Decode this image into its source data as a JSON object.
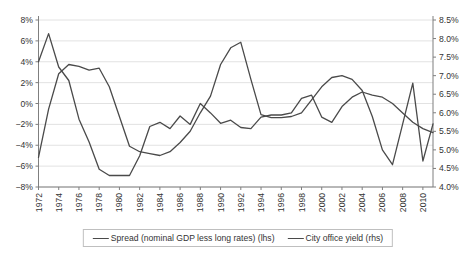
{
  "chart_data": {
    "type": "line",
    "x": [
      1972,
      1973,
      1974,
      1975,
      1976,
      1977,
      1978,
      1979,
      1980,
      1981,
      1982,
      1983,
      1984,
      1985,
      1986,
      1987,
      1988,
      1989,
      1990,
      1991,
      1992,
      1993,
      1994,
      1995,
      1996,
      1997,
      1998,
      1999,
      2000,
      2001,
      2002,
      2003,
      2004,
      2005,
      2006,
      2007,
      2008,
      2009,
      2010,
      2011
    ],
    "series": [
      {
        "name": "Spread (nominal GDP less long rates) (lhs)",
        "axis": "left",
        "values": [
          4.0,
          6.7,
          3.5,
          2.2,
          -1.5,
          -3.7,
          -6.3,
          -6.9,
          -6.9,
          -6.9,
          -5.0,
          -2.2,
          -1.8,
          -2.4,
          -1.2,
          -2.0,
          0.0,
          -0.9,
          -1.9,
          -1.6,
          -2.3,
          -2.4,
          -1.3,
          -1.1,
          -1.1,
          -0.9,
          0.5,
          0.8,
          -1.3,
          -1.8,
          -0.3,
          0.6,
          1.1,
          0.8,
          0.6,
          0.0,
          -0.9,
          -1.8,
          -2.4,
          -2.8
        ]
      },
      {
        "name": "City office yield (rhs)",
        "axis": "right",
        "values": [
          4.8,
          6.1,
          7.05,
          7.3,
          7.25,
          7.15,
          7.2,
          6.7,
          5.9,
          5.1,
          4.95,
          4.9,
          4.85,
          4.95,
          5.2,
          5.5,
          6.0,
          6.45,
          7.3,
          7.75,
          7.9,
          6.9,
          5.95,
          5.87,
          5.87,
          5.9,
          6.0,
          6.35,
          6.7,
          6.95,
          7.0,
          6.9,
          6.6,
          5.9,
          5.0,
          4.6,
          5.7,
          6.8,
          4.7,
          5.7
        ]
      }
    ],
    "left_axis": {
      "min": -8,
      "max": 8,
      "labels": [
        "8%",
        "6%",
        "4%",
        "2%",
        "0%",
        "−2%",
        "−4%",
        "−6%",
        "−8%"
      ],
      "label_values": [
        8,
        6,
        4,
        2,
        0,
        -2,
        -4,
        -6,
        -8
      ]
    },
    "right_axis": {
      "min": 4.0,
      "max": 8.5,
      "labels": [
        "8.5%",
        "8.0%",
        "7.5%",
        "7.0%",
        "6.5%",
        "6.0%",
        "5.5%",
        "5.0%",
        "4.5%",
        "4.0%"
      ],
      "label_values": [
        8.5,
        8.0,
        7.5,
        7.0,
        6.5,
        6.0,
        5.5,
        5.0,
        4.5,
        4.0
      ]
    },
    "x_tick_labels": [
      "1972",
      "1974",
      "1976",
      "1978",
      "1980",
      "1982",
      "1984",
      "1986",
      "1988",
      "1990",
      "1992",
      "1994",
      "1996",
      "1998",
      "2000",
      "2002",
      "2004",
      "2006",
      "2008",
      "2010"
    ],
    "x_tick_years": [
      1972,
      1974,
      1976,
      1978,
      1980,
      1982,
      1984,
      1986,
      1988,
      1990,
      1992,
      1994,
      1996,
      1998,
      2000,
      2002,
      2004,
      2006,
      2008,
      2010
    ],
    "grid": "on",
    "legend_position": "bottom",
    "line_color": "#4a4a4a",
    "grid_color": "#dadada",
    "axis_color": "#7f7f7f",
    "text_color": "#333333"
  }
}
